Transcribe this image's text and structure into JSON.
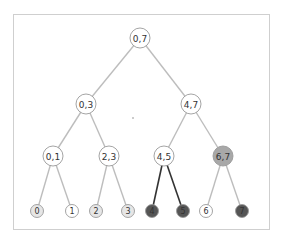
{
  "diagram": {
    "type": "segment-tree",
    "colors": {
      "edge": "#bdbdbd",
      "edge_highlight": "#333333",
      "node_fill": "#ffffff",
      "node_stroke": "#9a9a9a",
      "leaf_fill_light": "#e6e6e6",
      "node_fill_mid": "#a8a8a8",
      "node_fill_dark": "#555555"
    },
    "nodes": [
      {
        "id": "n07",
        "label": "0,7",
        "x": 140,
        "y": 38,
        "r": 10,
        "fill": "#ffffff"
      },
      {
        "id": "n03",
        "label": "0,3",
        "x": 86,
        "y": 104,
        "r": 10,
        "fill": "#ffffff"
      },
      {
        "id": "n47",
        "label": "4,7",
        "x": 191,
        "y": 104,
        "r": 10,
        "fill": "#ffffff"
      },
      {
        "id": "n01",
        "label": "0,1",
        "x": 53,
        "y": 156,
        "r": 10,
        "fill": "#ffffff"
      },
      {
        "id": "n23",
        "label": "2,3",
        "x": 109,
        "y": 156,
        "r": 10,
        "fill": "#ffffff"
      },
      {
        "id": "n45",
        "label": "4,5",
        "x": 164,
        "y": 156,
        "r": 10,
        "fill": "#ffffff"
      },
      {
        "id": "n67",
        "label": "6,7",
        "x": 223,
        "y": 156,
        "r": 10,
        "fill": "#a8a8a8"
      },
      {
        "id": "l0",
        "label": "0",
        "x": 37,
        "y": 211,
        "r": 6.5,
        "fill": "#e6e6e6"
      },
      {
        "id": "l1",
        "label": "1",
        "x": 72,
        "y": 211,
        "r": 6.5,
        "fill": "#ffffff"
      },
      {
        "id": "l2",
        "label": "2",
        "x": 96,
        "y": 211,
        "r": 6.5,
        "fill": "#e6e6e6"
      },
      {
        "id": "l3",
        "label": "3",
        "x": 128,
        "y": 211,
        "r": 6.5,
        "fill": "#e6e6e6"
      },
      {
        "id": "l4",
        "label": "4",
        "x": 152,
        "y": 211,
        "r": 6.5,
        "fill": "#555555"
      },
      {
        "id": "l5",
        "label": "5",
        "x": 183,
        "y": 211,
        "r": 6.5,
        "fill": "#555555"
      },
      {
        "id": "l6",
        "label": "6",
        "x": 206,
        "y": 211,
        "r": 6.5,
        "fill": "#ffffff"
      },
      {
        "id": "l7",
        "label": "7",
        "x": 242,
        "y": 211,
        "r": 6.5,
        "fill": "#555555"
      }
    ],
    "edges": [
      {
        "from": "n07",
        "to": "n03",
        "dark": false
      },
      {
        "from": "n07",
        "to": "n47",
        "dark": false
      },
      {
        "from": "n03",
        "to": "n01",
        "dark": false
      },
      {
        "from": "n03",
        "to": "n23",
        "dark": false
      },
      {
        "from": "n47",
        "to": "n45",
        "dark": false
      },
      {
        "from": "n47",
        "to": "n67",
        "dark": false
      },
      {
        "from": "n01",
        "to": "l0",
        "dark": false
      },
      {
        "from": "n01",
        "to": "l1",
        "dark": false
      },
      {
        "from": "n23",
        "to": "l2",
        "dark": false
      },
      {
        "from": "n23",
        "to": "l3",
        "dark": false
      },
      {
        "from": "n45",
        "to": "l4",
        "dark": true
      },
      {
        "from": "n45",
        "to": "l5",
        "dark": true
      },
      {
        "from": "n67",
        "to": "l6",
        "dark": false
      },
      {
        "from": "n67",
        "to": "l7",
        "dark": false
      }
    ],
    "center_dot": {
      "x": 133,
      "y": 118
    }
  }
}
